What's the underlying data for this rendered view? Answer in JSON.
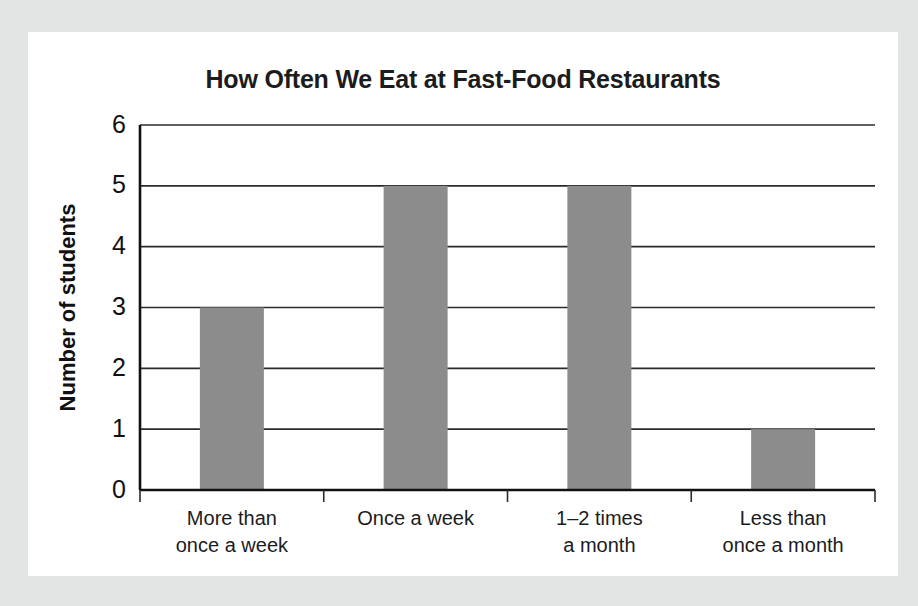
{
  "card": {
    "background_color": "#ffffff",
    "page_background_color": "#e3e4e4"
  },
  "chart_data": {
    "type": "bar",
    "title": "How Often We Eat at Fast-Food Restaurants",
    "xlabel": "",
    "ylabel": "Number of students",
    "categories": [
      "More than once a week",
      "Once a week",
      "1–2 times a month",
      "Less than once a month"
    ],
    "category_lines": [
      [
        "More than",
        "once a week"
      ],
      [
        "Once a week",
        ""
      ],
      [
        "1–2 times",
        "a month"
      ],
      [
        "Less than",
        "once a month"
      ]
    ],
    "values": [
      3,
      5,
      5,
      1
    ],
    "ylim": [
      0,
      6
    ],
    "ytick_labels": [
      "0",
      "1",
      "2",
      "3",
      "4",
      "5",
      "6"
    ],
    "ytick_values": [
      0,
      1,
      2,
      3,
      4,
      5,
      6
    ],
    "grid": true,
    "grid_axis": "y",
    "legend": false,
    "bar_color": "#8c8c8c",
    "axis_color": "#111111",
    "grid_color": "#2b2b2b"
  }
}
